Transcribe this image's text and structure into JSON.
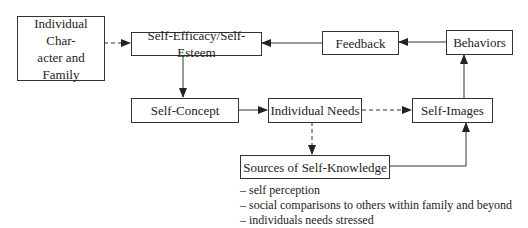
{
  "nodes": {
    "individual_character": "Individual Char-\nacter and Family",
    "individual_character_line1": "Individual Char-",
    "individual_character_line2": "acter and Family",
    "self_efficacy": "Self-Efficacy/Self-Esteem",
    "feedback": "Feedback",
    "behaviors": "Behaviors",
    "self_concept": "Self-Concept",
    "individual_needs": "Individual Needs",
    "self_images": "Self-Images",
    "sources": "Sources of Self-Knowledge"
  },
  "sources_list": [
    "– self perception",
    "– social comparisons to others within family and beyond",
    "– individuals needs stressed"
  ],
  "edges": [
    {
      "from": "individual_character",
      "to": "self_efficacy",
      "style": "dashed"
    },
    {
      "from": "feedback",
      "to": "self_efficacy",
      "style": "solid"
    },
    {
      "from": "behaviors",
      "to": "feedback",
      "style": "solid"
    },
    {
      "from": "self_efficacy",
      "to": "self_concept",
      "style": "solid"
    },
    {
      "from": "self_concept",
      "to": "individual_needs",
      "style": "solid"
    },
    {
      "from": "individual_needs",
      "to": "self_images",
      "style": "dashed"
    },
    {
      "from": "individual_needs",
      "to": "sources",
      "style": "dashed"
    },
    {
      "from": "sources",
      "to": "self_images",
      "style": "solid"
    },
    {
      "from": "self_images",
      "to": "behaviors",
      "style": "solid"
    }
  ]
}
